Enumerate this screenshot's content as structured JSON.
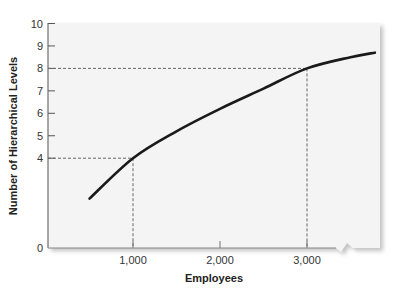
{
  "chart_data": {
    "type": "line",
    "title": "",
    "xlabel": "Employees",
    "ylabel": "Number of Hierarchical Levels",
    "xlim": [
      0,
      3900
    ],
    "ylim": [
      0,
      10
    ],
    "x_ticks": [
      {
        "value": 1000,
        "label": "1,000"
      },
      {
        "value": 2000,
        "label": "2,000"
      },
      {
        "value": 3000,
        "label": "3,000"
      }
    ],
    "y_ticks": [
      {
        "value": 0,
        "label": "0"
      },
      {
        "value": 4,
        "label": "4"
      },
      {
        "value": 5,
        "label": "5"
      },
      {
        "value": 6,
        "label": "6"
      },
      {
        "value": 7,
        "label": "7"
      },
      {
        "value": 8,
        "label": "8"
      },
      {
        "value": 9,
        "label": "9"
      },
      {
        "value": 10,
        "label": "10"
      }
    ],
    "grid": false,
    "x_axis_break": true,
    "series": [
      {
        "name": "Hierarchical levels",
        "x": [
          500,
          1000,
          1500,
          2000,
          2500,
          3000,
          3500,
          3780
        ],
        "y": [
          2.2,
          4.0,
          5.2,
          6.2,
          7.1,
          8.0,
          8.5,
          8.7
        ]
      }
    ],
    "reference_lines": [
      {
        "x": 1000,
        "y": 4,
        "style": "dashed"
      },
      {
        "x": 3000,
        "y": 8,
        "style": "dashed"
      }
    ],
    "colors": {
      "curve": "#1a1a1a",
      "plot_background": "#f4f4f4",
      "reference": "#666666",
      "axis": "#555555"
    }
  }
}
